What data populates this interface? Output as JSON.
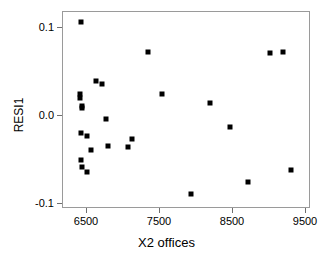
{
  "chart_data": {
    "type": "scatter",
    "title": "",
    "xlabel": "X2 offices",
    "ylabel": "RESI1",
    "xlim": [
      6350,
      9650
    ],
    "ylim": [
      -0.1,
      0.12
    ],
    "xticks": [
      6500,
      7500,
      8500,
      9500
    ],
    "xtick_labels": [
      "6500",
      "7500",
      "8500",
      "9500"
    ],
    "yticks": [
      0.1,
      0.0,
      -0.1
    ],
    "ytick_labels": [
      "0.1",
      "0.0",
      "-0.1"
    ],
    "grid": false,
    "legend": null,
    "marker": "filled-square",
    "marker_color": "#000000",
    "points": [
      {
        "x": 6415,
        "y": 0.107
      },
      {
        "x": 6405,
        "y": 0.025
      },
      {
        "x": 6410,
        "y": 0.021
      },
      {
        "x": 6425,
        "y": 0.011
      },
      {
        "x": 6430,
        "y": 0.009
      },
      {
        "x": 6420,
        "y": -0.019
      },
      {
        "x": 6415,
        "y": -0.05
      },
      {
        "x": 6425,
        "y": -0.058
      },
      {
        "x": 6500,
        "y": -0.064
      },
      {
        "x": 6505,
        "y": -0.023
      },
      {
        "x": 6560,
        "y": -0.039
      },
      {
        "x": 6620,
        "y": 0.04
      },
      {
        "x": 6700,
        "y": 0.036
      },
      {
        "x": 6760,
        "y": -0.003
      },
      {
        "x": 6790,
        "y": -0.034
      },
      {
        "x": 7055,
        "y": -0.035
      },
      {
        "x": 7120,
        "y": -0.026
      },
      {
        "x": 7330,
        "y": 0.073
      },
      {
        "x": 7530,
        "y": 0.025
      },
      {
        "x": 7920,
        "y": -0.089
      },
      {
        "x": 8180,
        "y": 0.015
      },
      {
        "x": 8460,
        "y": -0.012
      },
      {
        "x": 8710,
        "y": -0.075
      },
      {
        "x": 9010,
        "y": 0.072
      },
      {
        "x": 9190,
        "y": 0.073
      },
      {
        "x": 9290,
        "y": -0.061
      }
    ]
  }
}
